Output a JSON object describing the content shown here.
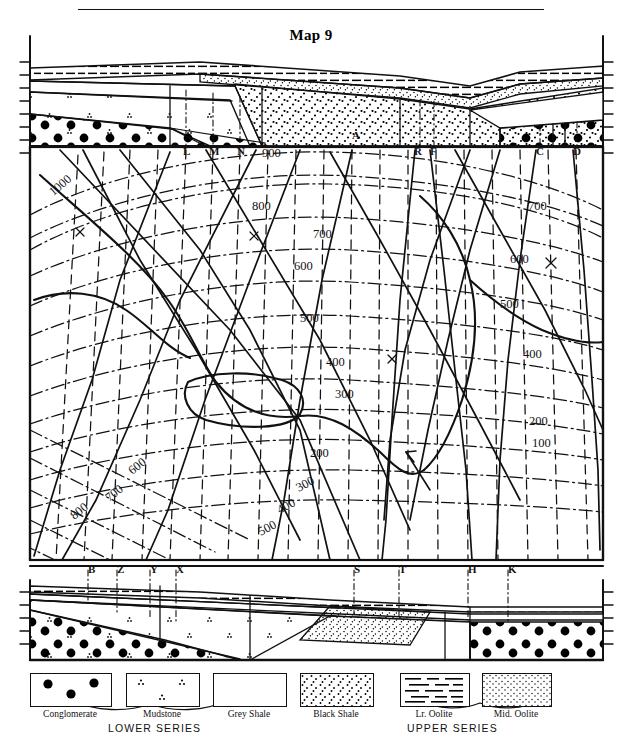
{
  "title": "Map 9",
  "map": {
    "top_letters": [
      {
        "label": "L",
        "x": 183,
        "y": 145
      },
      {
        "label": "M",
        "x": 210,
        "y": 145
      },
      {
        "label": "N",
        "x": 238,
        "y": 145
      },
      {
        "label": "A",
        "x": 352,
        "y": 140
      },
      {
        "label": "R",
        "x": 415,
        "y": 146
      },
      {
        "label": "F",
        "x": 430,
        "y": 146
      },
      {
        "label": "C",
        "x": 536,
        "y": 146
      },
      {
        "label": "D",
        "x": 573,
        "y": 146
      }
    ],
    "bottom_letters": [
      {
        "label": "B",
        "x": 88,
        "y": 563
      },
      {
        "label": "Z",
        "x": 117,
        "y": 563
      },
      {
        "label": "Y",
        "x": 150,
        "y": 563
      },
      {
        "label": "X",
        "x": 176,
        "y": 563
      },
      {
        "label": "S",
        "x": 354,
        "y": 563
      },
      {
        "label": "T",
        "x": 399,
        "y": 563
      },
      {
        "label": "H",
        "x": 468,
        "y": 563
      },
      {
        "label": "K",
        "x": 508,
        "y": 563
      }
    ],
    "contour_labels": [
      {
        "value": "1000",
        "x": 48,
        "y": 178,
        "rot": -40
      },
      {
        "value": "900",
        "x": 262,
        "y": 148,
        "rot": 0
      },
      {
        "value": "800",
        "x": 252,
        "y": 200,
        "rot": 0
      },
      {
        "value": "700",
        "x": 313,
        "y": 228,
        "rot": 0
      },
      {
        "value": "600",
        "x": 294,
        "y": 260,
        "rot": 0
      },
      {
        "value": "500",
        "x": 300,
        "y": 312,
        "rot": 0
      },
      {
        "value": "400",
        "x": 326,
        "y": 356,
        "rot": 0
      },
      {
        "value": "300",
        "x": 335,
        "y": 388,
        "rot": 0
      },
      {
        "value": "200",
        "x": 310,
        "y": 447,
        "rot": 0
      },
      {
        "value": "300",
        "x": 296,
        "y": 478,
        "rot": -28
      },
      {
        "value": "400",
        "x": 277,
        "y": 500,
        "rot": -28
      },
      {
        "value": "500",
        "x": 258,
        "y": 522,
        "rot": -28
      },
      {
        "value": "600",
        "x": 128,
        "y": 460,
        "rot": -38
      },
      {
        "value": "700",
        "x": 105,
        "y": 487,
        "rot": -38
      },
      {
        "value": "800",
        "x": 70,
        "y": 505,
        "rot": -38
      },
      {
        "value": "700",
        "x": 528,
        "y": 200,
        "rot": 0
      },
      {
        "value": "600",
        "x": 510,
        "y": 253,
        "rot": 0
      },
      {
        "value": "500",
        "x": 500,
        "y": 298,
        "rot": 0
      },
      {
        "value": "400",
        "x": 523,
        "y": 348,
        "rot": 0
      },
      {
        "value": "200",
        "x": 529,
        "y": 415,
        "rot": 0
      },
      {
        "value": "100",
        "x": 532,
        "y": 437,
        "rot": 0
      }
    ]
  },
  "legend": {
    "items": [
      {
        "name": "Conglomerate",
        "pattern": "conglomerate",
        "bx": 30,
        "bw": 80
      },
      {
        "name": "Mudstone",
        "pattern": "mudstone",
        "bx": 126,
        "bw": 72
      },
      {
        "name": "Grey Shale",
        "pattern": "grey-shale",
        "bx": 213,
        "bw": 72
      },
      {
        "name": "Black Shale",
        "pattern": "black-shale",
        "bx": 300,
        "bw": 72
      },
      {
        "name": "Lr. Oolite",
        "pattern": "lr-oolite",
        "bx": 400,
        "bw": 68
      },
      {
        "name": "Mid. Oolite",
        "pattern": "mid-oolite",
        "bx": 482,
        "bw": 68
      }
    ],
    "series": [
      {
        "name": "LOWER SERIES",
        "x": 108,
        "y": 52
      },
      {
        "name": "UPPER SERIES",
        "x": 407,
        "y": 52
      }
    ]
  }
}
